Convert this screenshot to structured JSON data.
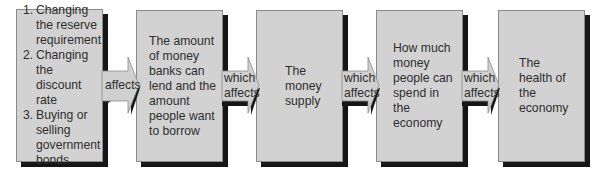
{
  "diagram": {
    "type": "flow-chain",
    "colors": {
      "box_fill": "#d2d2d2",
      "box_border": "#8a8a8a",
      "shadow": "#161616",
      "text": "#2e2e2e",
      "arrow_fill": "#d0d0d0"
    },
    "boxes": [
      {
        "id": "tools",
        "items": [
          {
            "num": "1.",
            "text": "Changing the reserve requirement"
          },
          {
            "num": "2.",
            "text": "Changing the discount rate"
          },
          {
            "num": "3.",
            "text": "Buying or selling government bonds"
          }
        ]
      },
      {
        "id": "lending",
        "text": "The amount of money banks can lend and the amount people want to borrow"
      },
      {
        "id": "money-supply",
        "text": "The money supply"
      },
      {
        "id": "spending",
        "text": "How much money people can spend in the economy"
      },
      {
        "id": "economy-health",
        "text": "The health of the economy"
      }
    ],
    "arrows": [
      {
        "label_line1": "affects",
        "label_line2": ""
      },
      {
        "label_line1": "which",
        "label_line2": "affects"
      },
      {
        "label_line1": "which",
        "label_line2": "affects"
      },
      {
        "label_line1": "which",
        "label_line2": "affects"
      }
    ]
  }
}
